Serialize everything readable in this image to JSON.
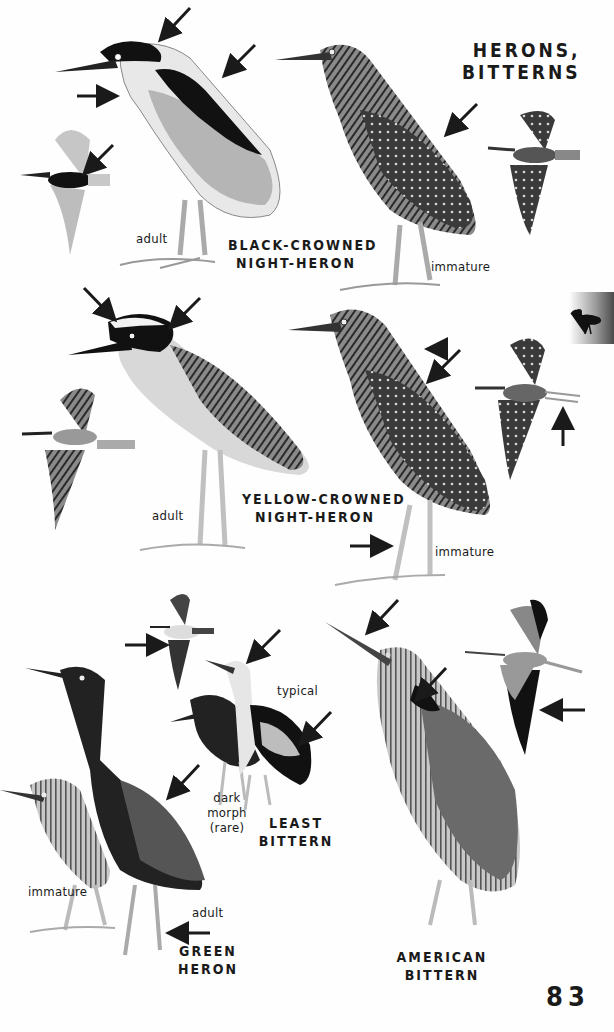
{
  "page": {
    "section_title_line1": "HERONS,",
    "section_title_line2": "BITTERNS",
    "page_number": "83",
    "thumb_tab_icon": "heron-silhouette-icon"
  },
  "species": [
    {
      "name_line1": "BLACK-CROWNED",
      "name_line2": "NIGHT-HERON",
      "labels": [
        "adult",
        "immature"
      ]
    },
    {
      "name_line1": "YELLOW-CROWNED",
      "name_line2": "NIGHT-HERON",
      "labels": [
        "adult",
        "immature"
      ]
    },
    {
      "name_line1": "LEAST",
      "name_line2": "BITTERN",
      "labels": [
        "typical",
        "dark",
        "morph",
        "(rare)"
      ]
    },
    {
      "name_line1": "GREEN",
      "name_line2": "HERON",
      "labels": [
        "immature",
        "adult"
      ]
    },
    {
      "name_line1": "AMERICAN",
      "name_line2": "BITTERN",
      "labels": []
    }
  ],
  "colors": {
    "ink": "#1a1a1a",
    "background": "#fefefe",
    "tab_dark": "#4a4a4a"
  }
}
